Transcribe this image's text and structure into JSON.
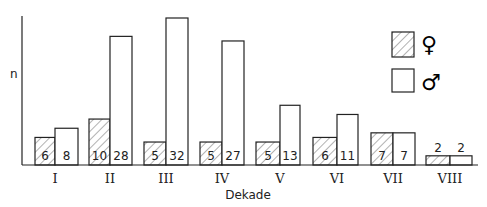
{
  "chart_data": {
    "type": "bar",
    "title": "",
    "xlabel": "Dekade",
    "ylabel": "n",
    "categories": [
      "I",
      "II",
      "III",
      "IV",
      "V",
      "VI",
      "VII",
      "VIII"
    ],
    "series": [
      {
        "name": "♀",
        "pattern": "hatched",
        "values": [
          6,
          10,
          5,
          5,
          5,
          6,
          7,
          2
        ]
      },
      {
        "name": "♂",
        "pattern": "empty",
        "values": [
          8,
          28,
          32,
          27,
          13,
          11,
          7,
          2
        ]
      }
    ],
    "ylim": [
      0,
      32
    ],
    "grid": false,
    "legend_position": "upper right"
  },
  "legend": {
    "female": "♀",
    "male": "♂"
  },
  "colors": {
    "stroke": "#222222",
    "background": "#ffffff"
  }
}
